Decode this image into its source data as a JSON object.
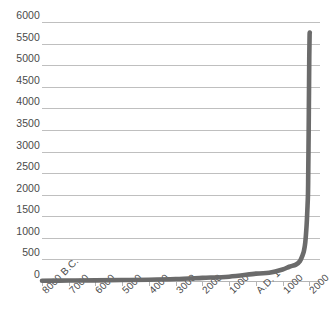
{
  "chart_data": {
    "type": "line",
    "title": "",
    "subtitle": "",
    "xlabel": "",
    "ylabel": "",
    "grid": true,
    "legend": "none",
    "line_color": "#6b6b6b",
    "gridline_color": "#bfbfbf",
    "axis_color": "#b5b5b5",
    "tick_label_color": "#4a4a4a",
    "ylim": [
      0,
      6000
    ],
    "ytick_values": [
      6000,
      5500,
      5000,
      4500,
      4000,
      3500,
      3000,
      2500,
      2000,
      1500,
      1000,
      500,
      0
    ],
    "ytick_labels": [
      "6000",
      "5500",
      "5000",
      "4500",
      "4000",
      "3500",
      "3000",
      "2500",
      "2000",
      "1500",
      "1000",
      "500",
      "0"
    ],
    "xtick_labels": [
      "8000 B.C.",
      "7000",
      "6000",
      "5000",
      "4000",
      "3000",
      "2000",
      "1000",
      "A.D. 1",
      "1000",
      "2000"
    ],
    "xtick_years": [
      -8000,
      -7000,
      -6000,
      -5000,
      -4000,
      -3000,
      -2000,
      -1000,
      1,
      1000,
      2000
    ],
    "xlim": [
      -8000,
      2400
    ],
    "series": [
      {
        "name": "World population (millions)",
        "x": [
          -8000,
          -7000,
          -6000,
          -5000,
          -4000,
          -3000,
          -2000,
          -1000,
          1,
          500,
          1000,
          1250,
          1500,
          1650,
          1750,
          1800,
          1850,
          1900,
          1927,
          1950,
          1960,
          1975,
          1987,
          1999,
          2011,
          2020
        ],
        "y": [
          5,
          10,
          15,
          22,
          30,
          45,
          72,
          100,
          170,
          190,
          265,
          400,
          425,
          500,
          720,
          900,
          1200,
          1650,
          2000,
          2500,
          3000,
          4000,
          5000,
          6000,
          7000,
          7800
        ],
        "y_plotted": [
          5,
          10,
          15,
          22,
          30,
          45,
          72,
          100,
          170,
          190,
          265,
          330,
          380,
          460,
          600,
          700,
          900,
          1300,
          1650,
          2000,
          2500,
          3400,
          4300,
          5200,
          5700,
          5750
        ]
      }
    ],
    "peak_value": 5750,
    "peak_description": "Steep near-vertical rise beginning around A.D. 1700, reaching just below 6000 at the right edge"
  }
}
